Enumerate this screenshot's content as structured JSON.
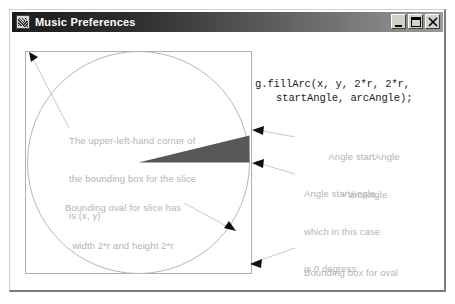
{
  "window": {
    "title": "Music Preferences",
    "icon": "music-note-icon",
    "buttons": [
      {
        "name": "minimize-button",
        "label": "_",
        "glyph": "minimize"
      },
      {
        "name": "maximize-button",
        "label": "□",
        "glyph": "maximize"
      },
      {
        "name": "close-button",
        "label": "✕",
        "glyph": "close"
      }
    ]
  },
  "code": {
    "line1": "g.fillArc(x, y, 2*r, 2*r,",
    "line2": "startAngle, arcAngle);"
  },
  "annotations": [
    {
      "name": "annotation-upper-left-corner",
      "lines": [
        "The upper-left-hand corner of",
        "the bounding box for the slice",
        "is (x, y)"
      ]
    },
    {
      "name": "annotation-end-angle",
      "lines": [
        "Angle startAngle",
        "+ arcAngle"
      ]
    },
    {
      "name": "annotation-start-angle",
      "lines": [
        "Angle startAngle,",
        "which in this case",
        "is 0 degress"
      ]
    },
    {
      "name": "annotation-bounding-oval",
      "lines": [
        "Bounding oval for slice has",
        "width 2*r and height 2*r"
      ]
    },
    {
      "name": "annotation-bounding-box",
      "lines": [
        "Bounding box for oval"
      ]
    }
  ],
  "diagram": {
    "bounding_box": {
      "x": 13,
      "y": 19,
      "width": 226,
      "height": 222
    },
    "circle": {
      "cx": 126,
      "cy": 130,
      "r": 111
    },
    "slice": {
      "fill_color": "#595959",
      "start_angle_deg": 0,
      "arc_angle_deg": 14,
      "apex": {
        "x": 126,
        "y": 130
      }
    },
    "colors": {
      "annotation_text": "#b4b4b4",
      "line": "#c8c8c8",
      "arrow": "#1a1a1a",
      "code_text": "#1a1a1a",
      "titlebar_text": "#ffffff"
    }
  }
}
